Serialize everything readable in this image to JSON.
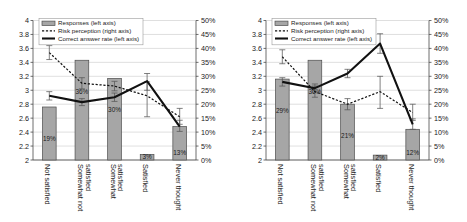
{
  "legend": {
    "items": [
      {
        "key": "responses",
        "label": "Responses",
        "axis_note": "(left axis)",
        "style": "bar"
      },
      {
        "key": "risk_perception",
        "label": "Risk perception",
        "axis_note": "(right axis)",
        "style": "dotted-line"
      },
      {
        "key": "correct_answer_rate",
        "label": "Correct answer rate",
        "axis_note": "(left axis)",
        "style": "solid-line"
      }
    ]
  },
  "colors": {
    "bar_fill": "#a6a6a6",
    "bar_stroke": "#4d4d4d",
    "line": "#111111",
    "grid": "#c9c9c9",
    "axis": "#4a4a4a",
    "text": "#1a1a1a"
  },
  "axes": {
    "left_ticks": [
      "4",
      "3.8",
      "3.6",
      "3.4",
      "3.2",
      "3",
      "2.8",
      "2.6",
      "2.4",
      "2.2",
      "2"
    ],
    "right_ticks": [
      "50%",
      "45%",
      "40%",
      "35%",
      "30%",
      "25%",
      "20%",
      "15%",
      "10%",
      "5%",
      "0%"
    ],
    "left_min": 2,
    "left_max": 4,
    "right_min": 0,
    "right_max": 50,
    "categories": [
      "Not satisfied",
      "Somewhat not satisfied",
      "Somewhat satisfied",
      "Satisfied",
      "Never thought"
    ]
  },
  "chart_data": [
    {
      "type": "bar",
      "panel": "left",
      "title": "",
      "xlabel": "",
      "ylabel": "",
      "categories": [
        "Not satisfied",
        "Somewhat not satisfied",
        "Somewhat satisfied",
        "Satisfied",
        "Never thought"
      ],
      "ylim": [
        2,
        4
      ],
      "y2lim": [
        0,
        50
      ],
      "grid": true,
      "legend_position": "top-left",
      "series": [
        {
          "name": "Responses",
          "type": "bar",
          "axis": "left",
          "values": [
            2.76,
            3.43,
            3.17,
            2.08,
            2.48
          ],
          "data_labels": [
            "19%",
            "36%",
            "30%",
            "3%",
            "13%"
          ],
          "data_label_values": [
            19,
            36,
            30,
            3,
            13
          ]
        },
        {
          "name": "Risk perception",
          "type": "dotted-line",
          "axis": "right",
          "values": [
            38.5,
            27.5,
            26.5,
            23.0,
            15.5
          ],
          "err_low": [
            36.0,
            25.5,
            24.8,
            15.5,
            12.8
          ],
          "err_high": [
            41.0,
            29.5,
            28.2,
            28.0,
            18.5
          ]
        },
        {
          "name": "Correct answer rate",
          "type": "solid-line",
          "axis": "left",
          "values": [
            2.92,
            2.83,
            2.9,
            3.13,
            2.48
          ],
          "err_low": [
            2.86,
            2.78,
            2.84,
            3.0,
            2.41
          ],
          "err_high": [
            2.98,
            2.88,
            2.96,
            3.24,
            2.57
          ]
        }
      ]
    },
    {
      "type": "bar",
      "panel": "right",
      "title": "",
      "xlabel": "",
      "ylabel": "",
      "categories": [
        "Not satisfied",
        "Somewhat not satisfied",
        "Somewhat satisfied",
        "Satisfied",
        "Never thought"
      ],
      "ylim": [
        2,
        4
      ],
      "y2lim": [
        0,
        50
      ],
      "grid": true,
      "legend_position": "top-left",
      "series": [
        {
          "name": "Responses",
          "type": "bar",
          "axis": "left",
          "values": [
            3.16,
            3.43,
            2.8,
            2.07,
            2.44
          ],
          "data_labels": [
            "29%",
            "36%",
            "21%",
            "2%",
            "12%"
          ],
          "data_label_values": [
            29,
            36,
            21,
            2,
            12
          ]
        },
        {
          "name": "Risk perception",
          "type": "dotted-line",
          "axis": "right",
          "values": [
            37.0,
            24.5,
            20.0,
            24.5,
            17.0
          ],
          "err_low": [
            34.5,
            22.5,
            18.0,
            18.5,
            14.2
          ],
          "err_high": [
            39.5,
            26.5,
            22.0,
            30.0,
            20.0
          ]
        },
        {
          "name": "Correct answer rate",
          "type": "solid-line",
          "axis": "left",
          "values": [
            3.12,
            3.03,
            3.24,
            3.67,
            2.51
          ],
          "err_low": [
            3.06,
            2.97,
            3.18,
            3.53,
            2.44
          ],
          "err_high": [
            3.18,
            3.09,
            3.3,
            3.81,
            2.59
          ]
        }
      ]
    }
  ]
}
